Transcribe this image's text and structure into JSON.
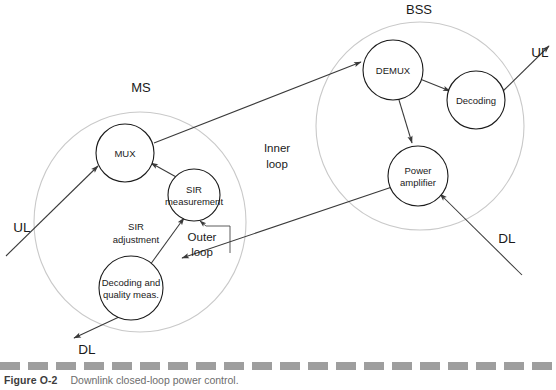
{
  "figure": {
    "caption_number": "Figure O-2",
    "caption_text": "Downlink closed-loop power control."
  },
  "groups": {
    "ms": {
      "label": "MS",
      "label_x": 141,
      "label_y": 92,
      "cx": 140,
      "cy": 222,
      "rx": 106,
      "ry": 110
    },
    "bss": {
      "label": "BSS",
      "label_x": 419,
      "label_y": 14,
      "cx": 420,
      "cy": 126,
      "rx": 104,
      "ry": 104
    }
  },
  "nodes": [
    {
      "id": "mux",
      "label_lines": [
        "MUX"
      ],
      "cx": 125,
      "cy": 153,
      "r": 29
    },
    {
      "id": "sir-measurement",
      "label_lines": [
        "SIR",
        "measurement"
      ],
      "cx": 194,
      "cy": 195,
      "r": 26
    },
    {
      "id": "decoding-quality-meas",
      "label_lines": [
        "Decoding and",
        "quality meas."
      ],
      "cx": 131,
      "cy": 288,
      "r": 32
    },
    {
      "id": "demux",
      "label_lines": [
        "DEMUX"
      ],
      "cx": 393,
      "cy": 70,
      "r": 30
    },
    {
      "id": "decoding",
      "label_lines": [
        "Decoding"
      ],
      "cx": 476,
      "cy": 100,
      "r": 29
    },
    {
      "id": "power-amplifier",
      "label_lines": [
        "Power",
        "amplifier"
      ],
      "cx": 418,
      "cy": 176,
      "r": 30
    }
  ],
  "io_labels": [
    {
      "id": "ul-left",
      "text": "UL",
      "x": 22,
      "y": 232
    },
    {
      "id": "dl-left",
      "text": "DL",
      "x": 87,
      "y": 354
    },
    {
      "id": "ul-right",
      "text": "UL",
      "x": 540,
      "y": 57
    },
    {
      "id": "dl-right",
      "text": "DL",
      "x": 507,
      "y": 243
    }
  ],
  "annotations": [
    {
      "id": "inner-loop",
      "lines": [
        "Inner",
        "loop"
      ],
      "x": 277,
      "y": 152,
      "line_height": 16
    },
    {
      "id": "outer-loop",
      "lines": [
        "Outer",
        "loop"
      ],
      "x": 202,
      "y": 241,
      "line_height": 15
    },
    {
      "id": "sir-adjustment",
      "lines": [
        "SIR",
        "adjustment"
      ],
      "x": 136,
      "y": 230,
      "line_height": 13
    }
  ],
  "connections": [
    {
      "id": "ul-in-to-mux",
      "from": "ul-input",
      "to": "mux"
    },
    {
      "id": "sir-measurement-to-mux",
      "from": "sir-measurement",
      "to": "mux"
    },
    {
      "id": "decoding-quality-to-sir-measurement",
      "from": "decoding-quality-meas",
      "to": "sir-measurement"
    },
    {
      "id": "outer-loop-feedback",
      "from": "dl-signal",
      "to": "sir-measurement"
    },
    {
      "id": "decoding-quality-to-dl-out",
      "from": "decoding-quality-meas",
      "to": "dl-output"
    },
    {
      "id": "mux-to-demux",
      "from": "mux",
      "to": "demux"
    },
    {
      "id": "demux-to-decoding",
      "from": "demux",
      "to": "decoding"
    },
    {
      "id": "demux-to-power-amplifier",
      "from": "demux",
      "to": "power-amplifier"
    },
    {
      "id": "decoding-to-ul-out",
      "from": "decoding",
      "to": "ul-output"
    },
    {
      "id": "dl-in-to-power-amplifier",
      "from": "dl-input",
      "to": "power-amplifier"
    },
    {
      "id": "power-amplifier-to-ms",
      "from": "power-amplifier",
      "to": "ms-receiver"
    }
  ],
  "colors": {
    "stroke": "#1a1a1a",
    "connector": "#3a3a3a",
    "group_outline": "#c9c9c9",
    "caption_text": "#6d6d6d",
    "caption_rule": "#9e9e9e",
    "background": "#ffffff"
  }
}
